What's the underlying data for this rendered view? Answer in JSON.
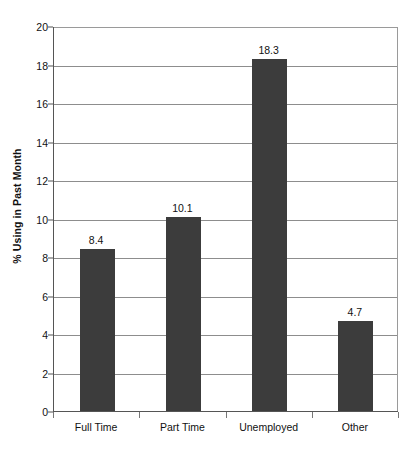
{
  "chart_data": {
    "type": "bar",
    "title": "",
    "xlabel": "",
    "ylabel": "% Using in Past Month",
    "categories": [
      "Full Time",
      "Part Time",
      "Unemployed",
      "Other"
    ],
    "values": [
      8.4,
      10.1,
      18.3,
      4.7
    ],
    "data_labels": [
      "8.4",
      "10.1",
      "18.3",
      "4.7"
    ],
    "ylim": [
      0,
      20
    ],
    "ytick_values": [
      0,
      2,
      4,
      6,
      8,
      10,
      12,
      14,
      16,
      18,
      20
    ],
    "ytick_labels": [
      "0",
      "2",
      "4",
      "6",
      "8",
      "10",
      "12",
      "14",
      "16",
      "18",
      "20"
    ],
    "grid": "horizontal",
    "legend": "none",
    "bar_color": "#3c3c3c",
    "gridline_color": "#8d8d8d",
    "axis_color": "#555555",
    "background_color": "#ffffff"
  }
}
